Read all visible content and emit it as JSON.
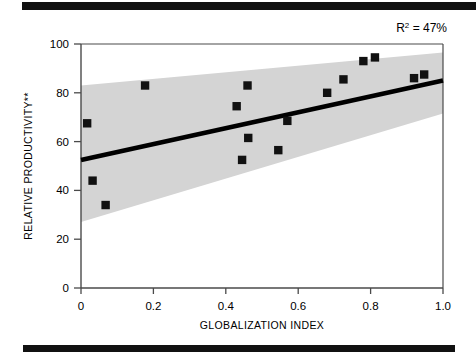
{
  "figure": {
    "annotation": "R2 = 47%",
    "annotation_base": "R",
    "annotation_exponent": "2",
    "annotation_rest": " = 47%"
  },
  "colors": {
    "rule": "#111111",
    "band": "#d4d4d4",
    "line": "#000000",
    "marker": "#111111",
    "axis": "#4a4a4a",
    "background": "#ffffff"
  },
  "chart_data": {
    "type": "scatter",
    "title": "",
    "subtitle": "",
    "xlabel": "GLOBALIZATION INDEX",
    "ylabel": "RELATIVE PRODUCTIVITY**",
    "xlim": [
      0,
      1.0
    ],
    "ylim": [
      0,
      100
    ],
    "xticks": [
      0,
      0.2,
      0.4,
      0.6,
      0.8,
      1.0
    ],
    "xticklabels": [
      "0",
      "0.2",
      "0.4",
      "0.6",
      "0.8",
      "1.0"
    ],
    "yticks": [
      0,
      20,
      40,
      60,
      80,
      100
    ],
    "yticklabels": [
      "0",
      "20",
      "40",
      "60",
      "80",
      "100"
    ],
    "grid": false,
    "legend": null,
    "annotations": [
      {
        "text": "R2 = 47%",
        "x": 0.92,
        "y": 104,
        "position": "top-right"
      }
    ],
    "points": [
      {
        "x": 0.017,
        "y": 67.5
      },
      {
        "x": 0.032,
        "y": 44.0
      },
      {
        "x": 0.068,
        "y": 34.0
      },
      {
        "x": 0.177,
        "y": 83.0
      },
      {
        "x": 0.43,
        "y": 74.5
      },
      {
        "x": 0.445,
        "y": 52.5
      },
      {
        "x": 0.46,
        "y": 83.0
      },
      {
        "x": 0.462,
        "y": 61.5
      },
      {
        "x": 0.545,
        "y": 56.5
      },
      {
        "x": 0.57,
        "y": 68.5
      },
      {
        "x": 0.68,
        "y": 80.0
      },
      {
        "x": 0.725,
        "y": 85.5
      },
      {
        "x": 0.78,
        "y": 93.0
      },
      {
        "x": 0.812,
        "y": 94.5
      },
      {
        "x": 0.92,
        "y": 86.0
      },
      {
        "x": 0.948,
        "y": 87.5
      }
    ],
    "fit_line": {
      "name": "regression-line",
      "x": [
        0.0,
        1.0
      ],
      "y": [
        52.5,
        85.0
      ],
      "r_squared_percent": 47
    },
    "confidence_band": {
      "name": "confidence-band",
      "x": [
        0.0,
        1.0
      ],
      "upper": [
        83.0,
        96.5
      ],
      "lower": [
        27.0,
        71.5
      ]
    }
  }
}
